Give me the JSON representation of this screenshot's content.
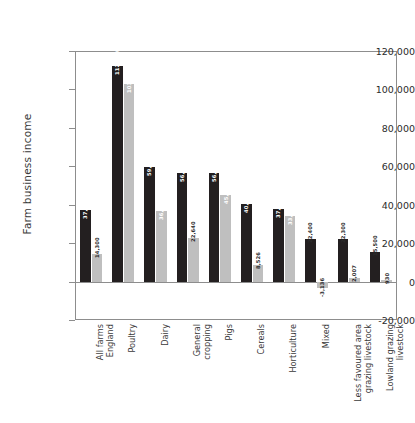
{
  "chart_data": {
    "type": "bar",
    "title": "",
    "xlabel": "",
    "ylabel": "Farm business income",
    "ylim": [
      -20000,
      120000
    ],
    "ytick_labels": [
      "120,000",
      "100,000",
      "80,000",
      "60,000",
      "40,000",
      "20,000",
      "0",
      "-20,000"
    ],
    "ytick_values": [
      120000,
      100000,
      80000,
      60000,
      40000,
      20000,
      0,
      -20000
    ],
    "grid": false,
    "legend_position": "none",
    "categories": [
      "All farms England",
      "Poultry",
      "Dairy",
      "General cropping",
      "Pigs",
      "Cereals",
      "Horticulture",
      "Mixed",
      "Less favoured area grazing livestock",
      "Lowland grazing livestock"
    ],
    "series": [
      {
        "name": "dark",
        "color": "#231f20",
        "values": [
          37020,
          112000,
          59600,
          56600,
          56600,
          40600,
          37700,
          22400,
          22300,
          15500
        ],
        "labels": [
          "37,020",
          "112,000",
          "59,600",
          "56,600",
          "56,600",
          "40,600",
          "37,700",
          "22,400",
          "22,300",
          "15,500"
        ]
      },
      {
        "name": "light",
        "color": "#bfbfbf",
        "values": [
          14300,
          103040,
          36953,
          22640,
          45280,
          8526,
          33930,
          -3136,
          2007,
          930
        ],
        "labels": [
          "14,300",
          "103,040",
          "36,953",
          "22,640",
          "45,280",
          "8,526",
          "33,930",
          "-3,136",
          "2,007",
          "930"
        ]
      }
    ]
  },
  "axis": {
    "y_title": "Farm business income"
  }
}
